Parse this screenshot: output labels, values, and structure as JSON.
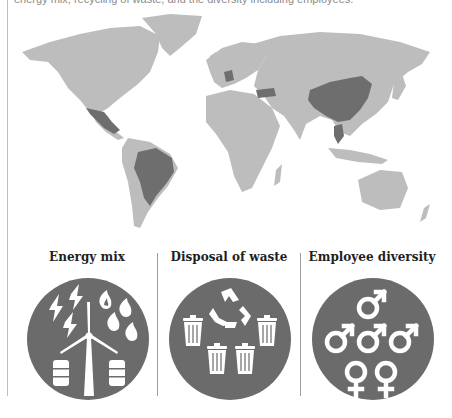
{
  "intro_text": "energy mix, recycling of waste, and the diversity including employees.",
  "map": {
    "base_color": "#bdbdbd",
    "highlight_color": "#6e6e6e",
    "highlighted_countries": [
      "Mexico",
      "Brazil",
      "Germany",
      "Turkey",
      "China",
      "Thailand"
    ]
  },
  "panels": [
    {
      "title": "Energy mix",
      "icons": [
        "lightning-bolt-icon",
        "flame-icon",
        "wind-turbine-icon",
        "oil-barrel-icon"
      ]
    },
    {
      "title": "Disposal of waste",
      "icons": [
        "recycle-icon",
        "trash-can-icon"
      ]
    },
    {
      "title": "Employee diversity",
      "icons": [
        "male-symbol-icon",
        "female-symbol-icon"
      ]
    }
  ],
  "colors": {
    "circle_fill": "#6b6b6b",
    "icon_fill": "#ffffff",
    "title_text": "#1f1f1f"
  }
}
